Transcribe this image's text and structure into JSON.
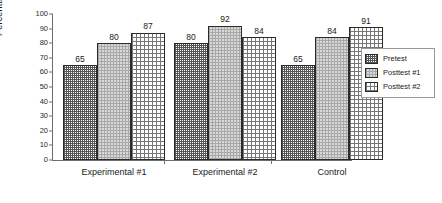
{
  "chart_data": {
    "type": "bar",
    "title": "",
    "xlabel": "",
    "ylabel": "Percentage",
    "ylim": [
      0,
      100
    ],
    "yticks": [
      0,
      10,
      20,
      30,
      40,
      50,
      60,
      70,
      80,
      90,
      100
    ],
    "grid": false,
    "legend_position": "right",
    "categories": [
      "Experimental #1",
      "Experimental #2",
      "Control"
    ],
    "series": [
      {
        "name": "Pretest",
        "values": [
          65,
          80,
          65
        ],
        "fill": "dense-checker",
        "color": "#555555"
      },
      {
        "name": "Posttest #1",
        "values": [
          80,
          92,
          84
        ],
        "fill": "light-dots",
        "color": "#d8d8d8"
      },
      {
        "name": "Posttest #2",
        "values": [
          87,
          84,
          91
        ],
        "fill": "crosshatch",
        "color": "#777777"
      }
    ],
    "data_labels": [
      [
        65,
        80,
        87
      ],
      [
        80,
        92,
        84
      ],
      [
        65,
        84,
        91
      ]
    ]
  },
  "legend": {
    "entries": [
      {
        "label": "Pretest"
      },
      {
        "label": "Posttest #1"
      },
      {
        "label": "Posttest #2"
      }
    ]
  },
  "axis": {
    "y_title": "Percentage"
  }
}
